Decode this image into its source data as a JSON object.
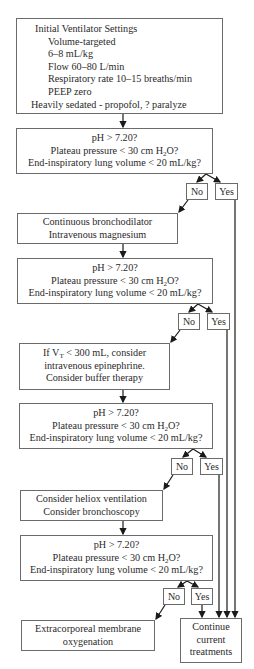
{
  "initial_settings": {
    "title": "Initial Ventilator Settings",
    "items": [
      "Volume-targeted",
      "6–8 mL/kg",
      "Flow 60–80 L/min",
      "Respiratory rate 10–15 breaths/min",
      "PEEP zero"
    ],
    "sedation": "Heavily sedated - propofol, ? paralyze"
  },
  "decision": {
    "line1": "pH > 7.20?",
    "line2_pre": "Plateau pressure < 30 cm H",
    "line2_sub": "2",
    "line2_post": "O?",
    "line3": "End-inspiratory lung volume < 20 mL/kg?"
  },
  "labels": {
    "no": "No",
    "yes": "Yes"
  },
  "step1": {
    "lines": [
      "Continuous bronchodilator",
      "Intravenous magnesium"
    ]
  },
  "step2": {
    "line1_pre": "If V",
    "line1_sub": "T",
    "line1_post": " < 300 mL, consider",
    "line2": "intravenous epinephrine.",
    "line3": "Consider buffer therapy"
  },
  "step3": {
    "lines": [
      "Consider heliox ventilation",
      "Consider bronchoscopy"
    ]
  },
  "ecmo": {
    "lines": [
      "Extracorporeal membrane",
      "oxygenation"
    ]
  },
  "continue": {
    "lines": [
      "Continue",
      "current",
      "treatments"
    ]
  },
  "colors": {
    "stroke": "#6b6b6b",
    "arrow": "#1a1a1a",
    "text": "#2a2a2a"
  }
}
